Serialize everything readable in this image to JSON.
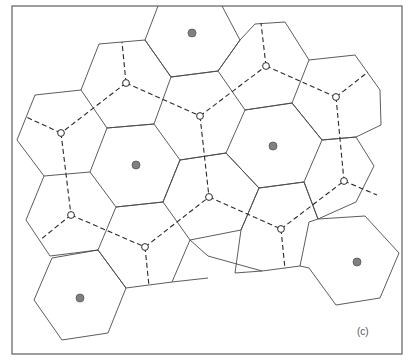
{
  "figure": {
    "label": "(c)",
    "colors": {
      "frame": "#6a6a6a",
      "cell_edge": "#4a4a4a",
      "dashed_link": "#2a2a2a",
      "site_fill": "#808080",
      "node_fill": "#ffffff"
    },
    "sites": [
      {
        "x": 192,
        "y": 33
      },
      {
        "x": 136,
        "y": 165
      },
      {
        "x": 273,
        "y": 146
      },
      {
        "x": 357,
        "y": 262
      },
      {
        "x": 80,
        "y": 298
      }
    ],
    "nodes": [
      {
        "id": "A",
        "x": 126,
        "y": 83
      },
      {
        "id": "B",
        "x": 61,
        "y": 133
      },
      {
        "id": "C",
        "x": 200,
        "y": 116
      },
      {
        "id": "D",
        "x": 266,
        "y": 66
      },
      {
        "id": "E",
        "x": 336,
        "y": 97
      },
      {
        "id": "F",
        "x": 71,
        "y": 215
      },
      {
        "id": "G",
        "x": 145,
        "y": 247
      },
      {
        "id": "H",
        "x": 209,
        "y": 197
      },
      {
        "id": "I",
        "x": 281,
        "y": 229
      },
      {
        "id": "J",
        "x": 344,
        "y": 181
      }
    ]
  }
}
